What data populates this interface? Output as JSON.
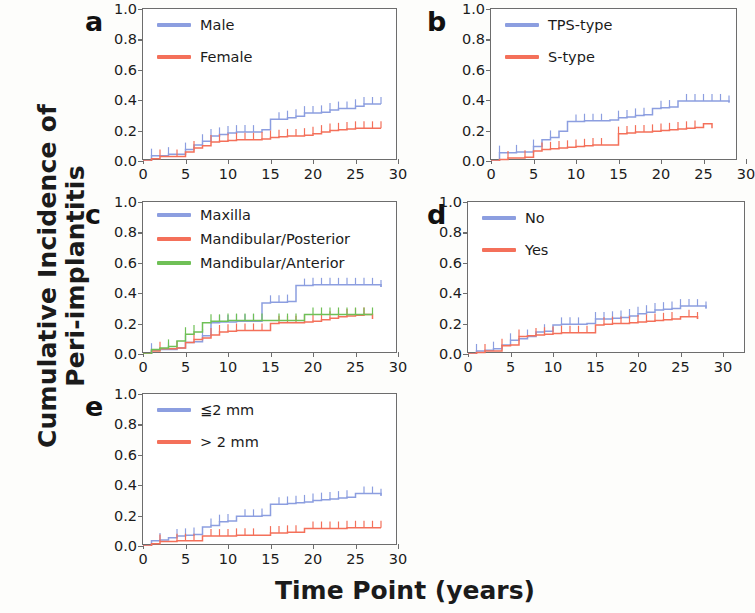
{
  "axes": {
    "ylabel_line1": "Cumulative Incidence of",
    "ylabel_line2": "Peri-implantitis",
    "xlabel": "Time Point (years)",
    "yticks": [
      "0.0",
      "0.2",
      "0.4",
      "0.6",
      "0.8",
      "1.0"
    ],
    "ytick_values": [
      0.0,
      0.2,
      0.4,
      0.6,
      0.8,
      1.0
    ],
    "xticks": [
      "0",
      "5",
      "10",
      "15",
      "20",
      "25",
      "30"
    ],
    "xtick_values": [
      0,
      5,
      10,
      15,
      20,
      25,
      30
    ],
    "ylim": [
      0.0,
      1.0
    ],
    "xlim": [
      0,
      30
    ]
  },
  "colors": {
    "blue": "#8c9ee0",
    "red": "#f4705a",
    "green": "#6fc057",
    "axis": "#6d6d6d",
    "text": "#1b1b1b",
    "background": "#fdfdfb"
  },
  "panels": [
    {
      "letter": "a"
    },
    {
      "letter": "b"
    },
    {
      "letter": "c"
    },
    {
      "letter": "d"
    },
    {
      "letter": "e"
    }
  ],
  "chart_data": [
    {
      "type": "line",
      "panel": "a",
      "title": "",
      "xlabel": "Time Point (years)",
      "ylabel": "Cumulative Incidence of Peri-implantitis",
      "xlim": [
        0,
        30
      ],
      "ylim": [
        0.0,
        1.0
      ],
      "grid": false,
      "legend_position": "top-left",
      "series": [
        {
          "name": "Male",
          "color": "#8c9ee0",
          "x": [
            0,
            1,
            2,
            3,
            4,
            5,
            6,
            7,
            8,
            9,
            10,
            11,
            12,
            13,
            14,
            15,
            16,
            17,
            18,
            19,
            20,
            21,
            22,
            23,
            24,
            25,
            26,
            27,
            28
          ],
          "y": [
            0.0,
            0.035,
            0.035,
            0.045,
            0.045,
            0.075,
            0.105,
            0.13,
            0.165,
            0.175,
            0.185,
            0.19,
            0.19,
            0.19,
            0.205,
            0.275,
            0.275,
            0.285,
            0.295,
            0.315,
            0.315,
            0.32,
            0.335,
            0.345,
            0.345,
            0.36,
            0.375,
            0.375,
            0.375
          ],
          "censor_x": [
            1,
            3,
            5,
            7,
            8,
            9,
            10,
            11,
            12,
            13,
            16,
            17,
            18,
            19,
            20,
            21,
            22,
            23,
            24,
            25,
            26,
            27,
            28
          ]
        },
        {
          "name": "Female",
          "color": "#f4705a",
          "x": [
            0,
            1,
            2,
            3,
            4,
            5,
            6,
            7,
            8,
            9,
            10,
            11,
            12,
            13,
            14,
            15,
            16,
            17,
            18,
            19,
            20,
            21,
            22,
            23,
            24,
            25,
            26,
            27,
            28
          ],
          "y": [
            0.0,
            0.015,
            0.03,
            0.03,
            0.03,
            0.06,
            0.085,
            0.1,
            0.125,
            0.13,
            0.135,
            0.14,
            0.14,
            0.14,
            0.145,
            0.155,
            0.16,
            0.165,
            0.165,
            0.17,
            0.18,
            0.19,
            0.2,
            0.205,
            0.21,
            0.215,
            0.215,
            0.215,
            0.215
          ],
          "censor_x": [
            2,
            4,
            6,
            8,
            9,
            10,
            11,
            12,
            13,
            14,
            15,
            16,
            17,
            18,
            19,
            20,
            21,
            22,
            23,
            24,
            25,
            26,
            27,
            28
          ]
        }
      ]
    },
    {
      "type": "line",
      "panel": "b",
      "xlim": [
        0,
        30
      ],
      "ylim": [
        0.0,
        1.0
      ],
      "grid": false,
      "legend_position": "top-left",
      "series": [
        {
          "name": "TPS-type",
          "color": "#8c9ee0",
          "x": [
            0,
            1,
            2,
            3,
            4,
            5,
            6,
            7,
            8,
            9,
            10,
            11,
            12,
            13,
            14,
            15,
            16,
            17,
            18,
            19,
            20,
            21,
            22,
            23,
            24,
            25,
            26,
            27,
            28
          ],
          "y": [
            0.0,
            0.055,
            0.055,
            0.06,
            0.06,
            0.095,
            0.14,
            0.155,
            0.195,
            0.26,
            0.26,
            0.265,
            0.265,
            0.265,
            0.27,
            0.285,
            0.29,
            0.3,
            0.305,
            0.345,
            0.35,
            0.355,
            0.395,
            0.395,
            0.395,
            0.395,
            0.395,
            0.395,
            0.385
          ],
          "censor_x": [
            1,
            3,
            5,
            7,
            10,
            11,
            12,
            13,
            15,
            16,
            17,
            18,
            20,
            21,
            23,
            24,
            25,
            26,
            27,
            28
          ]
        },
        {
          "name": "S-type",
          "color": "#f4705a",
          "x": [
            0,
            1,
            2,
            3,
            4,
            5,
            6,
            7,
            8,
            9,
            10,
            11,
            12,
            13,
            14,
            15,
            16,
            17,
            18,
            19,
            20,
            21,
            22,
            23,
            24,
            25,
            26
          ],
          "y": [
            0.0,
            0.01,
            0.02,
            0.02,
            0.025,
            0.065,
            0.075,
            0.08,
            0.085,
            0.09,
            0.095,
            0.1,
            0.105,
            0.105,
            0.105,
            0.18,
            0.185,
            0.19,
            0.19,
            0.195,
            0.2,
            0.205,
            0.21,
            0.215,
            0.22,
            0.245,
            0.215
          ],
          "censor_x": [
            2,
            4,
            6,
            7,
            8,
            9,
            10,
            11,
            12,
            13,
            15,
            16,
            17,
            18,
            19,
            20,
            21,
            22,
            23,
            24
          ]
        }
      ]
    },
    {
      "type": "line",
      "panel": "c",
      "xlim": [
        0,
        30
      ],
      "ylim": [
        0.0,
        1.0
      ],
      "grid": false,
      "legend_position": "top-left",
      "series": [
        {
          "name": "Maxilla",
          "color": "#8c9ee0",
          "x": [
            0,
            1,
            2,
            3,
            4,
            5,
            6,
            7,
            8,
            9,
            10,
            11,
            12,
            13,
            14,
            15,
            16,
            17,
            18,
            19,
            20,
            21,
            22,
            23,
            24,
            25,
            26,
            27,
            28
          ],
          "y": [
            0.0,
            0.025,
            0.03,
            0.03,
            0.04,
            0.075,
            0.08,
            0.12,
            0.205,
            0.21,
            0.21,
            0.215,
            0.215,
            0.215,
            0.335,
            0.34,
            0.34,
            0.345,
            0.45,
            0.45,
            0.455,
            0.455,
            0.455,
            0.455,
            0.455,
            0.455,
            0.455,
            0.455,
            0.44
          ],
          "censor_x": [
            1,
            3,
            5,
            7,
            9,
            10,
            11,
            12,
            13,
            15,
            16,
            17,
            19,
            20,
            21,
            22,
            23,
            24,
            25,
            26,
            27,
            28
          ]
        },
        {
          "name": "Mandibular/Posterior",
          "color": "#f4705a",
          "x": [
            0,
            1,
            2,
            3,
            4,
            5,
            6,
            7,
            8,
            9,
            10,
            11,
            12,
            13,
            14,
            15,
            16,
            17,
            18,
            19,
            20,
            21,
            22,
            23,
            24,
            25,
            26,
            27
          ],
          "y": [
            0.0,
            0.02,
            0.035,
            0.035,
            0.04,
            0.075,
            0.095,
            0.105,
            0.125,
            0.145,
            0.15,
            0.155,
            0.155,
            0.155,
            0.155,
            0.2,
            0.205,
            0.205,
            0.205,
            0.21,
            0.215,
            0.225,
            0.235,
            0.245,
            0.25,
            0.255,
            0.26,
            0.23
          ],
          "censor_x": [
            2,
            4,
            6,
            8,
            9,
            10,
            11,
            12,
            13,
            14,
            16,
            17,
            18,
            19,
            20,
            21,
            22,
            23,
            24,
            25,
            26
          ]
        },
        {
          "name": "Mandibular/Anterior",
          "color": "#6fc057",
          "x": [
            0,
            1,
            2,
            3,
            4,
            5,
            6,
            7,
            8,
            9,
            10,
            11,
            12,
            13,
            14,
            15,
            16,
            17,
            18,
            19,
            20,
            21,
            22,
            23,
            24,
            25,
            26,
            27
          ],
          "y": [
            0.0,
            0.03,
            0.04,
            0.05,
            0.085,
            0.13,
            0.145,
            0.205,
            0.215,
            0.215,
            0.22,
            0.22,
            0.22,
            0.22,
            0.22,
            0.22,
            0.22,
            0.22,
            0.22,
            0.26,
            0.26,
            0.26,
            0.26,
            0.26,
            0.26,
            0.26,
            0.26,
            0.26
          ],
          "censor_x": [
            3,
            5,
            6,
            8,
            9,
            10,
            11,
            12,
            13,
            14,
            16,
            17,
            18,
            20,
            21,
            22,
            23,
            24,
            25,
            26,
            27
          ]
        }
      ]
    },
    {
      "type": "line",
      "panel": "d",
      "xlim": [
        0,
        30
      ],
      "ylim": [
        0.0,
        1.0
      ],
      "grid": false,
      "legend_position": "top-left",
      "series": [
        {
          "name": "No",
          "color": "#8c9ee0",
          "x": [
            0,
            1,
            2,
            3,
            4,
            5,
            6,
            7,
            8,
            9,
            10,
            11,
            12,
            13,
            14,
            15,
            16,
            17,
            18,
            19,
            20,
            21,
            22,
            23,
            24,
            25,
            26,
            27,
            28
          ],
          "y": [
            0.0,
            0.02,
            0.025,
            0.035,
            0.06,
            0.09,
            0.1,
            0.115,
            0.145,
            0.15,
            0.19,
            0.195,
            0.195,
            0.195,
            0.2,
            0.23,
            0.23,
            0.235,
            0.24,
            0.25,
            0.265,
            0.275,
            0.29,
            0.295,
            0.3,
            0.315,
            0.315,
            0.315,
            0.3
          ],
          "censor_x": [
            1,
            3,
            5,
            7,
            9,
            11,
            12,
            13,
            15,
            16,
            17,
            18,
            19,
            20,
            21,
            22,
            23,
            24,
            25,
            26,
            27,
            28
          ]
        },
        {
          "name": "Yes",
          "color": "#f4705a",
          "x": [
            0,
            1,
            2,
            3,
            4,
            5,
            6,
            7,
            8,
            9,
            10,
            11,
            12,
            13,
            14,
            15,
            16,
            17,
            18,
            19,
            20,
            21,
            22,
            23,
            24,
            25,
            26,
            27
          ],
          "y": [
            0.0,
            0.01,
            0.02,
            0.02,
            0.055,
            0.06,
            0.115,
            0.12,
            0.125,
            0.13,
            0.135,
            0.14,
            0.14,
            0.14,
            0.14,
            0.19,
            0.195,
            0.2,
            0.2,
            0.205,
            0.21,
            0.215,
            0.22,
            0.225,
            0.23,
            0.245,
            0.245,
            0.23
          ],
          "censor_x": [
            2,
            4,
            6,
            8,
            9,
            10,
            11,
            12,
            13,
            14,
            16,
            17,
            18,
            19,
            20,
            21,
            22,
            23,
            24,
            26,
            27
          ]
        }
      ]
    },
    {
      "type": "line",
      "panel": "e",
      "xlim": [
        0,
        30
      ],
      "ylim": [
        0.0,
        1.0
      ],
      "grid": false,
      "legend_position": "top-left",
      "series": [
        {
          "name": "≦2 mm",
          "color": "#8c9ee0",
          "x": [
            0,
            1,
            2,
            3,
            4,
            5,
            6,
            7,
            8,
            9,
            10,
            11,
            12,
            13,
            14,
            15,
            16,
            17,
            18,
            19,
            20,
            21,
            22,
            23,
            24,
            25,
            26,
            27,
            28
          ],
          "y": [
            0.0,
            0.035,
            0.04,
            0.055,
            0.065,
            0.07,
            0.075,
            0.125,
            0.135,
            0.16,
            0.165,
            0.195,
            0.195,
            0.195,
            0.2,
            0.275,
            0.275,
            0.28,
            0.285,
            0.29,
            0.3,
            0.305,
            0.31,
            0.315,
            0.32,
            0.345,
            0.345,
            0.345,
            0.33
          ],
          "censor_x": [
            2,
            4,
            5,
            6,
            8,
            9,
            10,
            12,
            13,
            14,
            16,
            17,
            18,
            19,
            20,
            21,
            22,
            23,
            24,
            26,
            27,
            28
          ]
        },
        {
          "name": "> 2 mm",
          "color": "#f4705a",
          "x": [
            0,
            1,
            2,
            3,
            4,
            5,
            6,
            7,
            8,
            9,
            10,
            11,
            12,
            13,
            14,
            15,
            16,
            17,
            18,
            19,
            20,
            21,
            22,
            23,
            24,
            25,
            26,
            27,
            28
          ],
          "y": [
            0.0,
            0.015,
            0.03,
            0.03,
            0.035,
            0.035,
            0.035,
            0.065,
            0.065,
            0.065,
            0.065,
            0.07,
            0.07,
            0.07,
            0.07,
            0.085,
            0.085,
            0.09,
            0.09,
            0.115,
            0.115,
            0.115,
            0.115,
            0.115,
            0.12,
            0.12,
            0.12,
            0.12,
            0.12
          ],
          "censor_x": [
            2,
            4,
            5,
            6,
            8,
            9,
            10,
            11,
            12,
            13,
            15,
            16,
            17,
            18,
            20,
            21,
            22,
            23,
            24,
            25,
            26,
            27,
            28
          ]
        }
      ]
    }
  ]
}
